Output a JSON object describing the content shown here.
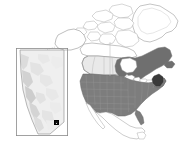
{
  "figure": {
    "name": "north-america-study-area-map",
    "background": "#ffffff",
    "width": 182,
    "height": 151
  },
  "colors": {
    "ocean_background": "#ffffff",
    "country_outline": "#8a8a8a",
    "usa_fill": "#7d7d7d",
    "eastern_canada_fill": "#6f6f6f",
    "western_canada_fill": "#e9e9e9",
    "unshaded_fill": "#ffffff",
    "highlight_state_fill": "#3a3a3a",
    "inset_border": "#8a8a8a",
    "inset_terrain_light": "#efefef",
    "inset_terrain_mid": "#d8d8d8",
    "inset_terrain_dark": "#bdbdbd",
    "marker_fill": "#111111",
    "meridian_line": "#bcbcbc"
  },
  "main_map": {
    "name": "north-america-reference-map",
    "projection_note": "lambert-conformal-conic",
    "shaded_regions": [
      {
        "id": "usa-lower-48",
        "label": "United States (contiguous)",
        "shade": "#7d7d7d",
        "has_state_boundaries": true
      },
      {
        "id": "eastern-canada",
        "label": "Ontario / Quebec / Maritimes / Newfoundland",
        "shade": "#6f6f6f"
      },
      {
        "id": "western-canada",
        "label": "British Columbia / Alberta / Saskatchewan / Manitoba",
        "shade": "#e9e9e9"
      },
      {
        "id": "highlight-northeast",
        "label": "Highlighted northeastern region",
        "shade": "#3a3a3a"
      }
    ],
    "unshaded_regions": [
      {
        "id": "alaska",
        "label": "Alaska"
      },
      {
        "id": "greenland",
        "label": "Greenland"
      },
      {
        "id": "arctic-archipelago",
        "label": "Canadian Arctic Archipelago"
      },
      {
        "id": "northern-territories",
        "label": "Yukon / Northwest Territories / Nunavut"
      },
      {
        "id": "mexico",
        "label": "Mexico"
      }
    ],
    "meridian": {
      "id": "central-meridian",
      "visible": true
    }
  },
  "inset_map": {
    "name": "alberta-relief-inset",
    "label": "Alberta",
    "border": true,
    "relief": "shaded terrain (Rocky Mountains along southwest edge)",
    "marker": {
      "id": "study-site-marker",
      "symbol": "filled-square",
      "color": "#111111",
      "x_pct": 78,
      "y_pct": 84
    }
  }
}
